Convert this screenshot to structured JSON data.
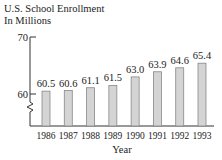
{
  "chart_data": {
    "type": "bar",
    "title": "U.S. School Enrollment",
    "subtitle": "In Millions",
    "xlabel": "Year",
    "ylabel": "",
    "categories": [
      "1986",
      "1987",
      "1988",
      "1989",
      "1990",
      "1991",
      "1992",
      "1993"
    ],
    "values": [
      60.5,
      60.6,
      61.1,
      61.5,
      63.0,
      63.9,
      64.6,
      65.4
    ],
    "value_labels": [
      "60.5",
      "60.6",
      "61.1",
      "61.5",
      "63.0",
      "63.9",
      "64.6",
      "65.4"
    ],
    "y_ticks": [
      60,
      70
    ],
    "y_tick_labels": [
      "60",
      "70"
    ],
    "ylim": [
      60,
      70
    ],
    "axis_break": true,
    "grid": false,
    "legend": null,
    "bar_color": "#d4d4d4",
    "bar_edge_color": "#888888"
  }
}
